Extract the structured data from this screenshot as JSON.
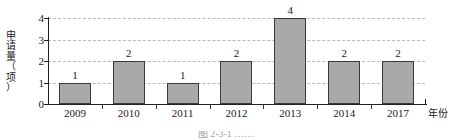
{
  "chart_data": {
    "type": "bar",
    "title": "",
    "categories": [
      "2009",
      "2010",
      "2011",
      "2012",
      "2013",
      "2014",
      "2017"
    ],
    "values": [
      1,
      2,
      1,
      2,
      4,
      2,
      2
    ],
    "data_labels": [
      "1",
      "2",
      "1",
      "2",
      "4",
      "2",
      "2"
    ],
    "xlabel": "年份",
    "ylabel": "申请量（项）",
    "ylabel_chars": [
      "申",
      "请",
      "量",
      "（",
      "项",
      "）"
    ],
    "ytick_labels": [
      "4",
      "3",
      "2",
      "1",
      "0"
    ],
    "ytick_values": [
      4,
      3,
      2,
      1,
      0
    ],
    "ylim": [
      0,
      4
    ],
    "grid": "horizontal-dashed",
    "legend": "none",
    "bar_color": "#a9a9a9",
    "bar_border_color": "#3a3a3a",
    "grid_color": "#b9b9b9",
    "axis_color": "#222222"
  },
  "figure": {
    "caption_clipped": "图 2-3-1 ……"
  }
}
